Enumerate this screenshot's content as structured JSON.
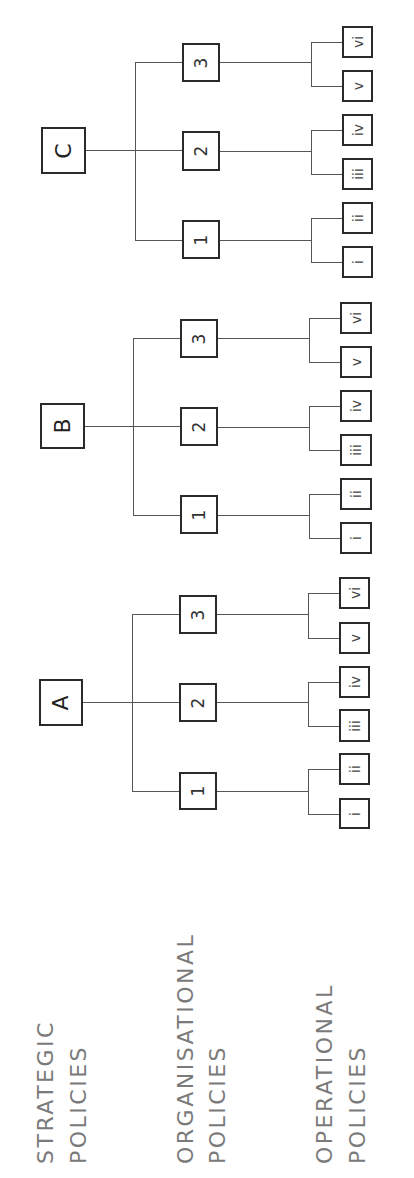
{
  "diagram": {
    "orientation": "rotated-90-ccw",
    "colors": {
      "box_border": "#2a2a2a",
      "connector": "#555555",
      "label_text": "#7a7a7a",
      "background": "#ffffff"
    },
    "levels": [
      {
        "line1": "STRATEGIC",
        "line2": "POLICIES"
      },
      {
        "line1": "ORGANISATIONAL",
        "line2": "POLICIES"
      },
      {
        "line1": "OPERATIONAL",
        "line2": "POLICIES"
      }
    ],
    "trees": [
      {
        "root": "C",
        "children": [
          {
            "label": "3",
            "leaves": [
              "vi",
              "v"
            ]
          },
          {
            "label": "2",
            "leaves": [
              "iv",
              "iii"
            ]
          },
          {
            "label": "1",
            "leaves": [
              "ii",
              "i"
            ]
          }
        ]
      },
      {
        "root": "B",
        "children": [
          {
            "label": "3",
            "leaves": [
              "vi",
              "v"
            ]
          },
          {
            "label": "2",
            "leaves": [
              "iv",
              "iii"
            ]
          },
          {
            "label": "1",
            "leaves": [
              "ii",
              "i"
            ]
          }
        ]
      },
      {
        "root": "A",
        "children": [
          {
            "label": "3",
            "leaves": [
              "vi",
              "v"
            ]
          },
          {
            "label": "2",
            "leaves": [
              "iv",
              "iii"
            ]
          },
          {
            "label": "1",
            "leaves": [
              "ii",
              "i"
            ]
          }
        ]
      }
    ]
  }
}
